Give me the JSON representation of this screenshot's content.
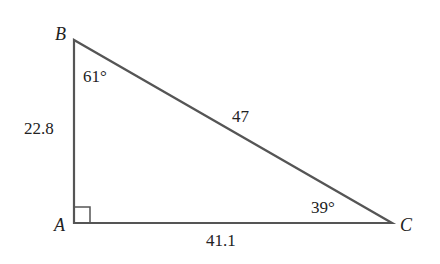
{
  "diagram": {
    "type": "right-triangle",
    "stroke_color": "#555555",
    "text_color": "#222222",
    "vertices": {
      "A": {
        "label": "A",
        "x": 74,
        "y": 223
      },
      "B": {
        "label": "B",
        "x": 74,
        "y": 40
      },
      "C": {
        "label": "C",
        "x": 392,
        "y": 223
      }
    },
    "sides": {
      "AB": {
        "label": "22.8"
      },
      "BC": {
        "label": "47"
      },
      "AC": {
        "label": "41.1"
      }
    },
    "angles": {
      "B": {
        "label": "61°"
      },
      "C": {
        "label": "39°"
      },
      "A": {
        "marker": "right-angle"
      }
    }
  }
}
